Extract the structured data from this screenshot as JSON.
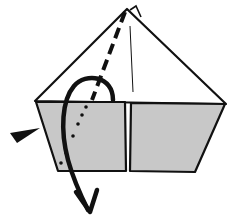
{
  "diagram": {
    "type": "origami-fold-step",
    "colors": {
      "paper_white": "#ffffff",
      "paper_gray": "#c8c8c8",
      "ink": "#111111"
    },
    "elements": [
      {
        "name": "top-triangle",
        "kind": "paper-flap-white"
      },
      {
        "name": "left-trapezoid-flap",
        "kind": "paper-flap-gray"
      },
      {
        "name": "right-trapezoid-flap",
        "kind": "paper-flap-gray"
      },
      {
        "name": "center-crease",
        "kind": "crease-line"
      },
      {
        "name": "valley-fold-dashed-line",
        "kind": "fold-line"
      },
      {
        "name": "hidden-dotted-line",
        "kind": "hidden-edge"
      },
      {
        "name": "fold-behind-arrow",
        "kind": "curved-arrow"
      },
      {
        "name": "push-pointer",
        "kind": "wedge-pointer"
      }
    ]
  }
}
